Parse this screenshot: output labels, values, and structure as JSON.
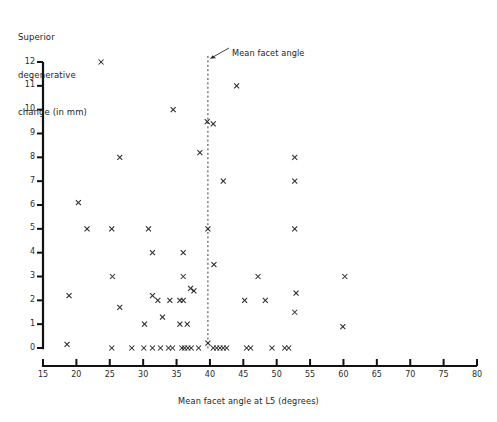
{
  "figure": {
    "title_y_lines": [
      "Superior",
      "degenerative",
      "change (in mm)"
    ],
    "xlabel": "Mean facet angle at L5  (degrees)",
    "annotation": "Mean facet angle",
    "background": "#ffffff",
    "marker_color": "#2a2a2a",
    "axis_color": "#111111"
  },
  "chart_data": {
    "type": "scatter",
    "title": "",
    "xlabel": "Mean facet angle at L5  (degrees)",
    "ylabel": "Superior degenerative change (in mm)",
    "xlim": [
      15,
      80
    ],
    "ylim": [
      0,
      12
    ],
    "xticks": [
      15,
      20,
      25,
      30,
      35,
      40,
      45,
      50,
      55,
      60,
      65,
      70,
      75,
      80
    ],
    "yticks": [
      0,
      1,
      2,
      3,
      4,
      5,
      6,
      7,
      8,
      9,
      10,
      11,
      12
    ],
    "grid": false,
    "legend": null,
    "marker": "x",
    "annotations": [
      {
        "text": "Mean facet angle",
        "x": 39.7,
        "y": 12.0,
        "type": "vline-callout"
      }
    ],
    "reference_lines": [
      {
        "orientation": "vertical",
        "value": 39.7,
        "style": "dashed",
        "label": "Mean facet angle"
      }
    ],
    "points": [
      [
        23.7,
        12.0
      ],
      [
        44.0,
        11.0
      ],
      [
        34.5,
        10.0
      ],
      [
        39.6,
        9.5
      ],
      [
        40.5,
        9.4
      ],
      [
        38.5,
        8.2
      ],
      [
        52.7,
        8.0
      ],
      [
        26.5,
        8.0
      ],
      [
        42.0,
        7.0
      ],
      [
        52.7,
        7.0
      ],
      [
        20.3,
        6.1
      ],
      [
        21.6,
        5.0
      ],
      [
        25.3,
        5.0
      ],
      [
        30.8,
        5.0
      ],
      [
        39.7,
        5.0
      ],
      [
        52.7,
        5.0
      ],
      [
        31.4,
        4.0
      ],
      [
        36.0,
        4.0
      ],
      [
        40.6,
        3.5
      ],
      [
        25.4,
        3.0
      ],
      [
        36.0,
        3.0
      ],
      [
        47.2,
        3.0
      ],
      [
        60.2,
        3.0
      ],
      [
        37.1,
        2.5
      ],
      [
        37.6,
        2.4
      ],
      [
        52.9,
        2.3
      ],
      [
        18.9,
        2.2
      ],
      [
        31.4,
        2.2
      ],
      [
        32.2,
        2.0
      ],
      [
        34.0,
        2.0
      ],
      [
        35.5,
        2.0
      ],
      [
        36.0,
        2.0
      ],
      [
        45.2,
        2.0
      ],
      [
        48.3,
        2.0
      ],
      [
        26.5,
        1.7
      ],
      [
        52.7,
        1.5
      ],
      [
        32.9,
        1.3
      ],
      [
        30.2,
        1.0
      ],
      [
        35.5,
        1.0
      ],
      [
        36.6,
        1.0
      ],
      [
        59.9,
        0.9
      ],
      [
        39.7,
        0.2
      ],
      [
        18.6,
        0.15
      ],
      [
        25.3,
        0.0
      ],
      [
        28.3,
        0.0
      ],
      [
        30.1,
        0.0
      ],
      [
        31.4,
        0.0
      ],
      [
        32.6,
        0.0
      ],
      [
        33.8,
        0.0
      ],
      [
        34.4,
        0.0
      ],
      [
        35.8,
        0.0
      ],
      [
        36.2,
        0.0
      ],
      [
        36.7,
        0.0
      ],
      [
        37.2,
        0.0
      ],
      [
        38.3,
        0.0
      ],
      [
        40.5,
        0.0
      ],
      [
        41.0,
        0.0
      ],
      [
        41.5,
        0.0
      ],
      [
        42.0,
        0.0
      ],
      [
        42.5,
        0.0
      ],
      [
        45.5,
        0.0
      ],
      [
        46.1,
        0.0
      ],
      [
        49.3,
        0.0
      ],
      [
        51.2,
        0.0
      ],
      [
        51.8,
        0.0
      ]
    ]
  }
}
